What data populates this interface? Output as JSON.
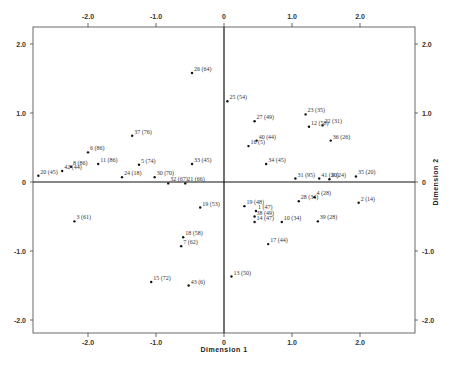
{
  "chart_data": {
    "type": "scatter",
    "title": "",
    "xlabel": "Dimension 1",
    "ylabel": "Dimension 2",
    "xlim": [
      -2.8,
      2.8
    ],
    "ylim": [
      -2.3,
      2.3
    ],
    "x_ticks": [
      "-2.0",
      "-1.0",
      "0",
      "1.0",
      "2.0"
    ],
    "y_ticks": [
      "2.0",
      "1.0",
      "0",
      "-1.0",
      "-2.0"
    ],
    "grid": false,
    "points": [
      {
        "label": "26 (64)",
        "x": -0.47,
        "y": 1.58
      },
      {
        "label": "25 (54)",
        "x": 0.05,
        "y": 1.17
      },
      {
        "label": "27 (49)",
        "x": 0.45,
        "y": 0.88
      },
      {
        "label": "23 (35)",
        "x": 1.2,
        "y": 0.98
      },
      {
        "label": "12 (58)",
        "x": 1.25,
        "y": 0.8
      },
      {
        "label": "22 (31)",
        "x": 1.45,
        "y": 0.82
      },
      {
        "label": "36 (26)",
        "x": 1.57,
        "y": 0.6
      },
      {
        "label": "40 (44)",
        "x": 0.48,
        "y": 0.6
      },
      {
        "label": "16 (5)",
        "x": 0.36,
        "y": 0.52
      },
      {
        "label": "34 (45)",
        "x": 0.62,
        "y": 0.26
      },
      {
        "label": "31 (95)",
        "x": 1.05,
        "y": 0.05
      },
      {
        "label": "41 (20)",
        "x": 1.4,
        "y": 0.05
      },
      {
        "label": "9 (24)",
        "x": 1.55,
        "y": 0.04
      },
      {
        "label": "35 (20)",
        "x": 1.94,
        "y": 0.08
      },
      {
        "label": "37 (76)",
        "x": -1.35,
        "y": 0.67
      },
      {
        "label": "6 (86)",
        "x": -2.0,
        "y": 0.43
      },
      {
        "label": "8 (86)",
        "x": -2.25,
        "y": 0.22
      },
      {
        "label": "11 (86)",
        "x": -1.85,
        "y": 0.26
      },
      {
        "label": "42 (44)",
        "x": -2.38,
        "y": 0.16
      },
      {
        "label": "20 (45)",
        "x": -2.73,
        "y": 0.09
      },
      {
        "label": "5 (74)",
        "x": -1.25,
        "y": 0.25
      },
      {
        "label": "24 (18)",
        "x": -1.5,
        "y": 0.07
      },
      {
        "label": "30 (70)",
        "x": -1.02,
        "y": 0.07
      },
      {
        "label": "33 (45)",
        "x": -0.47,
        "y": 0.26
      },
      {
        "label": "32 (67)",
        "x": -0.82,
        "y": -0.02
      },
      {
        "label": "21 (66)",
        "x": -0.57,
        "y": -0.02
      },
      {
        "label": "19 (53)",
        "x": -0.35,
        "y": -0.37
      },
      {
        "label": "18 (58)",
        "x": -0.6,
        "y": -0.8
      },
      {
        "label": "7 (62)",
        "x": -0.63,
        "y": -0.93
      },
      {
        "label": "3 (61)",
        "x": -2.2,
        "y": -0.57
      },
      {
        "label": "15 (72)",
        "x": -1.07,
        "y": -1.45
      },
      {
        "label": "43 (6)",
        "x": -0.52,
        "y": -1.5
      },
      {
        "label": "13 (50)",
        "x": 0.11,
        "y": -1.37
      },
      {
        "label": "17 (44)",
        "x": 0.65,
        "y": -0.9
      },
      {
        "label": "19 (48)",
        "x": 0.3,
        "y": -0.35
      },
      {
        "label": "1 (47)",
        "x": 0.47,
        "y": -0.42
      },
      {
        "label": "38 (49)",
        "x": 0.45,
        "y": -0.5
      },
      {
        "label": "14 (47)",
        "x": 0.45,
        "y": -0.58
      },
      {
        "label": "10 (34)",
        "x": 0.85,
        "y": -0.58
      },
      {
        "label": "28 (34)",
        "x": 1.1,
        "y": -0.28
      },
      {
        "label": "4 (28)",
        "x": 1.33,
        "y": -0.22
      },
      {
        "label": "39 (28)",
        "x": 1.38,
        "y": -0.57
      },
      {
        "label": "2 (14)",
        "x": 1.98,
        "y": -0.3
      }
    ]
  }
}
